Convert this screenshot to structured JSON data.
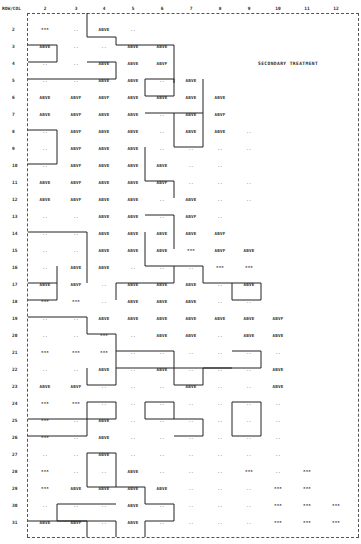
{
  "header": {
    "row_col_label": "ROW/COL",
    "columns": [
      "2",
      "3",
      "4",
      "5",
      "6",
      "7",
      "8",
      "9",
      "10",
      "11",
      "12"
    ]
  },
  "title": "SECONDARY TREATMENT",
  "rows": [
    {
      "row": "2",
      "cells": [
        "***",
        "..",
        "ABVE",
        "..",
        "",
        "",
        "",
        "",
        "",
        "",
        ""
      ]
    },
    {
      "row": "3",
      "cells": [
        "ABVE",
        "..",
        "..",
        "ABVE",
        "ABVE",
        "",
        "",
        "",
        "",
        "",
        ""
      ]
    },
    {
      "row": "4",
      "cells": [
        "..",
        "..",
        "ABVE",
        "ABVE",
        "ABVF",
        "",
        "",
        "",
        "",
        "",
        ""
      ]
    },
    {
      "row": "5",
      "cells": [
        "..",
        "..",
        "ABVE",
        "ABVE",
        "..",
        "ABVE",
        "",
        "",
        "",
        "",
        ""
      ]
    },
    {
      "row": "6",
      "cells": [
        "ABVE",
        "ABVF",
        "ABVF",
        "ABVE",
        "ABVE",
        "ABVE",
        "ABVE",
        "",
        "",
        "",
        ""
      ]
    },
    {
      "row": "7",
      "cells": [
        "ABVE",
        "ABVF",
        "ABVE",
        "ABVE",
        "..",
        "ABVE",
        "ABVF",
        "",
        "",
        "",
        ""
      ]
    },
    {
      "row": "8",
      "cells": [
        "..",
        "ABVF",
        "ABVE",
        "ABVE",
        "..",
        "ABVE",
        "ABVE",
        "..",
        "",
        "",
        ""
      ]
    },
    {
      "row": "9",
      "cells": [
        "..",
        "ABVF",
        "ABVE",
        "ABVE",
        "..",
        "..",
        "..",
        "..",
        "",
        "",
        ""
      ]
    },
    {
      "row": "10",
      "cells": [
        "..",
        "ABVF",
        "ABVE",
        "ABVE",
        "ABVE",
        "..",
        "..",
        "",
        "",
        "",
        ""
      ]
    },
    {
      "row": "11",
      "cells": [
        "ABVE",
        "ABVF",
        "ABVE",
        "ABVE",
        "ABVF",
        "..",
        "..",
        "..",
        "",
        "",
        ""
      ]
    },
    {
      "row": "12",
      "cells": [
        "ABVE",
        "ABVF",
        "ABVE",
        "ABVE",
        "..",
        "ABVE",
        "..",
        "..",
        "",
        "",
        ""
      ]
    },
    {
      "row": "13",
      "cells": [
        "..",
        "..",
        "ABVE",
        "ABVE",
        "..",
        "ABVF",
        "..",
        "",
        "",
        "",
        ""
      ]
    },
    {
      "row": "14",
      "cells": [
        "..",
        "..",
        "ABVE",
        "ABVE",
        "ABVE",
        "ABVE",
        "ABVF",
        "",
        "",
        "",
        ""
      ]
    },
    {
      "row": "15",
      "cells": [
        "..",
        "..",
        "ABVE",
        "ABVE",
        "ABVE",
        "***",
        "ABVF",
        "ABVE",
        "",
        "",
        ""
      ]
    },
    {
      "row": "16",
      "cells": [
        "..",
        "ABVE",
        "ABVE",
        "..",
        "..",
        "..",
        "***",
        "***",
        "",
        "",
        ""
      ]
    },
    {
      "row": "17",
      "cells": [
        "ABVE",
        "ABVF",
        "..",
        "ABVE",
        "ABVE",
        "ABVE",
        "..",
        "ABVE",
        "",
        "",
        ""
      ]
    },
    {
      "row": "18",
      "cells": [
        "***",
        "***",
        "..",
        "ABVE",
        "ABVE",
        "ABVE",
        "..",
        "..",
        "",
        "",
        ""
      ]
    },
    {
      "row": "19",
      "cells": [
        "..",
        "..",
        "ABVE",
        "ABVE",
        "ABVE",
        "ABVE",
        "ABVE",
        "ABVE",
        "ABVF",
        "",
        ""
      ]
    },
    {
      "row": "20",
      "cells": [
        "..",
        "..",
        "***",
        "..",
        "ABVE",
        "ABVE",
        "..",
        "ABVE",
        "ABVE",
        "",
        ""
      ]
    },
    {
      "row": "21",
      "cells": [
        "***",
        "***",
        "***",
        "..",
        "..",
        "..",
        "..",
        "..",
        "..",
        "",
        ""
      ]
    },
    {
      "row": "22",
      "cells": [
        "..",
        "..",
        "ABVE",
        "..",
        "ABVE",
        "..",
        "..",
        "..",
        "ABVE",
        "",
        ""
      ]
    },
    {
      "row": "23",
      "cells": [
        "ABVE",
        "ABVF",
        "..",
        "..",
        "..",
        "ABVE",
        "..",
        "..",
        "ABVE",
        "",
        ""
      ]
    },
    {
      "row": "24",
      "cells": [
        "***",
        "***",
        "..",
        "..",
        "..",
        "..",
        "..",
        "..",
        "..",
        "",
        ""
      ]
    },
    {
      "row": "25",
      "cells": [
        "***",
        "..",
        "ABVE",
        "..",
        "..",
        "..",
        "..",
        "..",
        "..",
        "",
        ""
      ]
    },
    {
      "row": "26",
      "cells": [
        "***",
        "..",
        "ABVE",
        "..",
        "..",
        "..",
        "..",
        "..",
        "..",
        "",
        ""
      ]
    },
    {
      "row": "27",
      "cells": [
        "..",
        "..",
        "ABVE",
        "..",
        "..",
        "..",
        "..",
        "..",
        "..",
        "",
        ""
      ]
    },
    {
      "row": "28",
      "cells": [
        "***",
        "..",
        "..",
        "ABVE",
        "..",
        "..",
        "..",
        "***",
        "..",
        "***",
        ""
      ]
    },
    {
      "row": "29",
      "cells": [
        "***",
        "ABVE",
        "ABVE",
        "ABVE",
        "ABVE",
        "..",
        "..",
        "..",
        "***",
        "***",
        ""
      ]
    },
    {
      "row": "30",
      "cells": [
        "..",
        "..",
        "..",
        "ABVE",
        "..",
        "..",
        "..",
        "..",
        "***",
        "***",
        "***"
      ]
    },
    {
      "row": "31",
      "cells": [
        "ABVE",
        "ABVF",
        "..",
        "ABVE",
        "..",
        "..",
        "..",
        "..",
        "***",
        "***",
        "***"
      ]
    }
  ]
}
